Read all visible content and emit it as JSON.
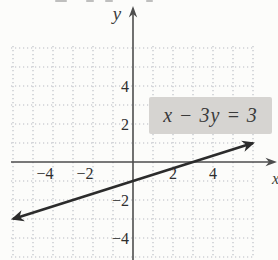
{
  "figure": {
    "background": "#fcfcfa",
    "grid_color": "#b7bac1",
    "axis_color": "#4d4d4d",
    "line_color": "#2b2b2b",
    "tick_color": "#2e2e2e"
  },
  "axes": {
    "x_label": "x",
    "y_label": "y"
  },
  "equation_label": {
    "text": "x − 3y = 3",
    "background": "#d6d4d1",
    "color": "#3a3a3a"
  },
  "chart_data": {
    "type": "line",
    "title": "",
    "equation": "x − 3y = 3",
    "xlabel": "x",
    "ylabel": "y",
    "xlim": [
      -6.5,
      7.2
    ],
    "ylim": [
      -5.2,
      8.2
    ],
    "grid": true,
    "grid_style": "dotted",
    "grid_step": 1,
    "series": [
      {
        "name": "x − 3y = 3",
        "slope": 0.3333,
        "x_intercept": 3,
        "y_intercept": -1,
        "points": [
          [
            -6,
            -3
          ],
          [
            -3,
            -2
          ],
          [
            0,
            -1
          ],
          [
            3,
            0
          ],
          [
            6,
            1
          ]
        ],
        "arrows": "both-ends"
      }
    ],
    "x_ticks": [
      {
        "v": -4,
        "label": "−4"
      },
      {
        "v": -2,
        "label": "−2"
      },
      {
        "v": 2,
        "label": "2"
      },
      {
        "v": 4,
        "label": "4"
      }
    ],
    "y_ticks": [
      {
        "v": 4,
        "label": "4"
      },
      {
        "v": 2,
        "label": "2"
      },
      {
        "v": -2,
        "label": "−2"
      },
      {
        "v": -4,
        "label": "−4"
      }
    ],
    "annotations": [
      {
        "text": "x − 3y = 3",
        "highlighted": true,
        "position": "upper-right"
      }
    ]
  }
}
